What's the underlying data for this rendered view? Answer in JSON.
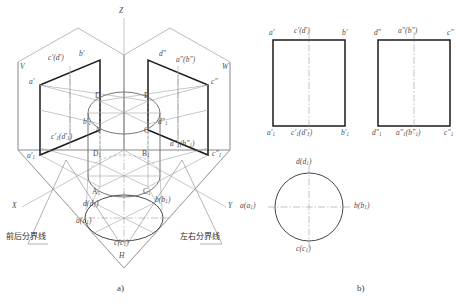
{
  "figure": {
    "title_a": "a)",
    "title_b": "b)",
    "colors": {
      "outline": "#1a1a1a",
      "thin_line": "#8c8c8c",
      "center_line": "#9a9a9a",
      "label": "#4a4a4a",
      "chinese_label": "#2e2e2e",
      "background": "#ffffff"
    }
  },
  "axonometric": {
    "axes": [
      {
        "name": "z-axis-label",
        "text": "Z"
      },
      {
        "name": "x-axis-label",
        "text": "X"
      },
      {
        "name": "y-axis-label",
        "text": "Y"
      }
    ],
    "planes": [
      {
        "name": "v-plane-label",
        "text": "V"
      },
      {
        "name": "w-plane-label",
        "text": "W"
      },
      {
        "name": "h-plane-label",
        "text": "H"
      }
    ],
    "front_projection_labels": [
      {
        "name": "label-a-prime",
        "text": "a′"
      },
      {
        "name": "label-cd-prime",
        "text": "c′(d′)"
      },
      {
        "name": "label-b-prime",
        "text": "b′"
      },
      {
        "name": "label-a1-prime",
        "text": "a′",
        "sub": "1"
      },
      {
        "name": "label-c1d1-prime",
        "text": "c′₁(d′₁)"
      },
      {
        "name": "label-b1-prime",
        "text": "b′₁"
      }
    ],
    "side_projection_labels": [
      {
        "name": "label-d-double-prime",
        "text": "d″"
      },
      {
        "name": "label-ab-double-prime",
        "text": "a″(b″)"
      },
      {
        "name": "label-c-double-prime",
        "text": "c″"
      },
      {
        "name": "label-d1-double-prime",
        "text": "d″₁"
      },
      {
        "name": "label-a1b1-double-prime",
        "text": "a″₁(b″₁)"
      },
      {
        "name": "label-c1-double-prime",
        "text": "c″₁"
      }
    ],
    "space_point_labels": [
      {
        "name": "label-point-d",
        "text": "D"
      },
      {
        "name": "label-point-b",
        "text": "B"
      },
      {
        "name": "label-point-a",
        "text": "A"
      },
      {
        "name": "label-point-c",
        "text": "C"
      },
      {
        "name": "label-point-d1",
        "text": "D₁"
      },
      {
        "name": "label-point-b1",
        "text": "B₁"
      },
      {
        "name": "label-point-a1",
        "text": "A₁"
      },
      {
        "name": "label-point-c1",
        "text": "C₁"
      }
    ],
    "horizontal_projection_labels": [
      {
        "name": "label-dd1-h",
        "text": "d(d₁)"
      },
      {
        "name": "label-aa1-h",
        "text": "a(a₁)"
      },
      {
        "name": "label-bb1-h",
        "text": "b(b₁)"
      },
      {
        "name": "label-cc1-h",
        "text": "c(c₁)"
      }
    ],
    "annotations": [
      {
        "name": "front-back-dividing-line-label",
        "text": "前后分界线"
      },
      {
        "name": "left-right-dividing-line-label",
        "text": "左右分界线"
      }
    ]
  },
  "orthographic": {
    "front_view": {
      "name": "front-view",
      "top_labels": [
        "a′",
        "c′(d′)",
        "b′"
      ],
      "bottom_labels": [
        "a′₁",
        "c′₁(d′₁)",
        "b′₁"
      ]
    },
    "side_view": {
      "name": "side-view",
      "top_labels": [
        "d″",
        "a″(b″)",
        "c″"
      ],
      "bottom_labels": [
        "d″₁",
        "a″₁(b″₁)",
        "c″₁"
      ]
    },
    "top_view": {
      "name": "top-view",
      "labels": {
        "top": "d(d₁)",
        "left": "a(a₁)",
        "right": "b(b₁)",
        "bottom": "c(c₁)"
      }
    }
  }
}
